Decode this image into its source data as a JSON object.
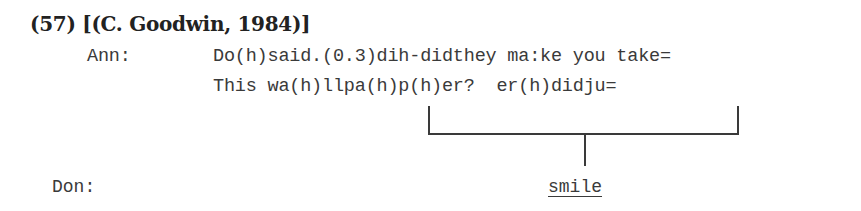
{
  "example": {
    "number": "(57)",
    "heading": "(57) [(C. Goodwin, 1984)]",
    "citation": "[(C. Goodwin, 1984)]"
  },
  "transcript": {
    "turns": [
      {
        "speaker": "Ann:",
        "lines": [
          "Do(h)said.(0.3)dih-didthey ma:ke you take=",
          "This wa(h)llpa(h)p(h)er?  er(h)didju="
        ]
      },
      {
        "speaker": "Don:",
        "lines": [
          "smile"
        ]
      }
    ]
  },
  "annotation": {
    "bracket_span_start": "(h)p(h)er?",
    "bracket_span_end": "didju=",
    "linked_to": "smile",
    "underlined": true
  }
}
